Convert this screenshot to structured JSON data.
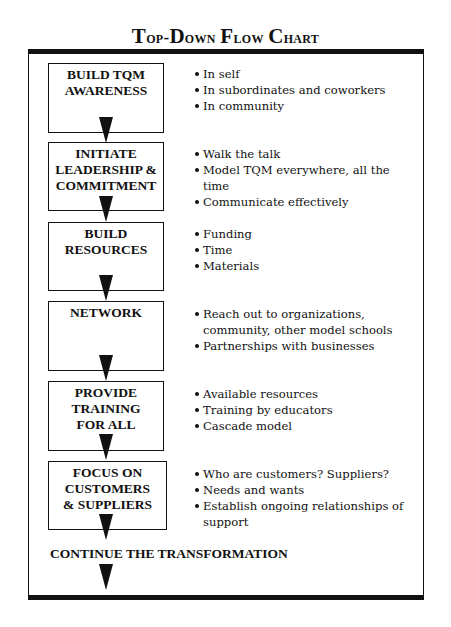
{
  "title": "Top-Down Flow Chart",
  "title_parts": {
    "t1_big": "T",
    "t1_rest": "op-",
    "t2_big": "D",
    "t2_rest": "own ",
    "t3_big": "F",
    "t3_rest": "low ",
    "t4_big": "C",
    "t4_rest": "hart"
  },
  "steps": [
    {
      "label": "BUILD TQM\nAWARENESS",
      "bullets": [
        "In self",
        "In subordinates and coworkers",
        "In community"
      ]
    },
    {
      "label": "INITIATE\nLEADERSHIP &\nCOMMITMENT",
      "bullets": [
        "Walk the talk",
        "Model TQM everywhere, all the time",
        "Communicate effectively"
      ]
    },
    {
      "label": "BUILD\nRESOURCES",
      "bullets": [
        "Funding",
        "Time",
        "Materials"
      ]
    },
    {
      "label": "NETWORK",
      "bullets": [
        "Reach out to organizations, community, other model schools",
        "Partnerships with businesses"
      ]
    },
    {
      "label": "PROVIDE\nTRAINING\nFOR ALL",
      "bullets": [
        "Available resources",
        "Training by educators",
        "Cascade model"
      ]
    },
    {
      "label": "FOCUS ON\nCUSTOMERS\n& SUPPLIERS",
      "bullets": [
        "Who are customers? Suppliers?",
        "Needs and wants",
        "Establish ongoing relationships of support"
      ]
    }
  ],
  "final_step": "CONTINUE THE TRANSFORMATION",
  "colors": {
    "ink": "#111111",
    "background": "#ffffff"
  }
}
